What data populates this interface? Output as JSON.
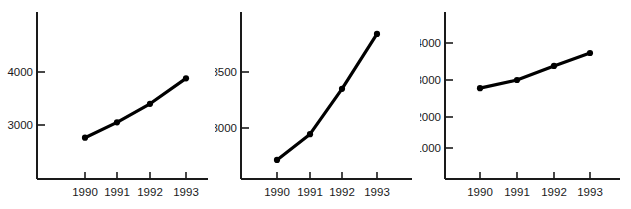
{
  "figure": {
    "background": "#ffffff",
    "ink": "#000000",
    "panel_count": 3
  },
  "chart_data": [
    {
      "id": "panel-left",
      "type": "line",
      "title": "",
      "xlabel": "",
      "ylabel": "",
      "categories": [
        "1990",
        "1991",
        "1992",
        "1993"
      ],
      "values": [
        2760,
        3050,
        3400,
        3880
      ],
      "ytick_labels": [
        "3000",
        "4000"
      ],
      "yticks": [
        3000,
        4000
      ],
      "ylim": [
        2280,
        4430
      ],
      "grid": false,
      "legend": null,
      "marker": "filled-circle",
      "line_color": "#000000"
    },
    {
      "id": "panel-middle",
      "type": "line",
      "title": "",
      "xlabel": "",
      "ylabel": "",
      "categories": [
        "1990",
        "1991",
        "1992",
        "1993"
      ],
      "values": [
        2715,
        2945,
        3350,
        3840
      ],
      "ytick_labels": [
        "3000",
        "3500"
      ],
      "yticks": [
        3000,
        3500
      ],
      "ylim": [
        2640,
        3960
      ],
      "grid": false,
      "legend": null,
      "marker": "filled-circle",
      "line_color": "#000000"
    },
    {
      "id": "panel-right",
      "type": "line",
      "title": "",
      "xlabel": "",
      "ylabel": "",
      "categories": [
        "1990",
        "1991",
        "1992",
        "1993"
      ],
      "values": [
        2780,
        3000,
        3380,
        3730
      ],
      "ytick_labels": [
        "1000",
        "2000",
        "3000",
        "4000"
      ],
      "yticks": [
        1000,
        2000,
        3000,
        4000
      ],
      "ylim": [
        300,
        4850
      ],
      "grid": false,
      "legend": null,
      "marker": "filled-circle",
      "line_color": "#000000"
    }
  ]
}
